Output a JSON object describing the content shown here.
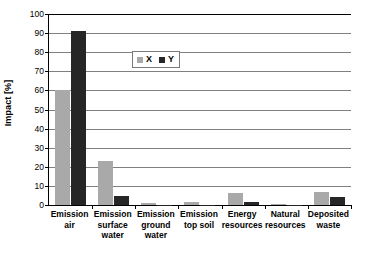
{
  "chart_data": {
    "type": "bar",
    "title": "",
    "xlabel": "",
    "ylabel": "Impact [%]",
    "ylim": [
      0,
      100
    ],
    "ytick_step": 10,
    "yticks": [
      100,
      90,
      80,
      70,
      60,
      50,
      40,
      30,
      20,
      10,
      0
    ],
    "grid": true,
    "legend_position": "inside-top-center",
    "categories": [
      "Emission air",
      "Emission surface water",
      "Emission ground water",
      "Emission top soil",
      "Energy resources",
      "Natural resources",
      "Deposited waste"
    ],
    "category_lines": [
      [
        "Emission",
        "air"
      ],
      [
        "Emission",
        "surface",
        "water"
      ],
      [
        "Emission",
        "ground",
        "water"
      ],
      [
        "Emission",
        "top soil"
      ],
      [
        "Energy",
        "resources"
      ],
      [
        "Natural",
        "resources"
      ],
      [
        "Deposited",
        "waste"
      ]
    ],
    "series": [
      {
        "name": "X",
        "color": "#a9a9a9",
        "values": [
          60,
          23,
          1,
          1.5,
          6.5,
          0.3,
          7
        ]
      },
      {
        "name": "Y",
        "color": "#262626",
        "values": [
          91,
          4.5,
          0.2,
          0.2,
          1.5,
          0.2,
          4
        ]
      }
    ]
  },
  "axis": {
    "y_title": "Impact [%]"
  },
  "legend": {
    "items": [
      {
        "label": "X"
      },
      {
        "label": "Y"
      }
    ]
  },
  "colors": {
    "series_x": "#a9a9a9",
    "series_y": "#262626",
    "gridline": "#808080",
    "axis": "#000000",
    "background": "#ffffff"
  }
}
